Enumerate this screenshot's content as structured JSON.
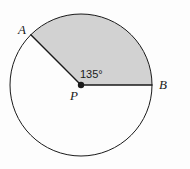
{
  "figure": {
    "kind": "circle-sector-diagram",
    "background_color": "#fdfdfd",
    "stroke_color": "#1a1a1a",
    "sector_fill_color": "#d2d2d2",
    "labels": {
      "point_a": "A",
      "point_b": "B",
      "center_p": "P",
      "angle": "135°"
    },
    "geometry": {
      "center_x": 81,
      "center_y": 85,
      "radius": 71,
      "start_angle_deg": 0,
      "end_angle_deg": 135,
      "sector_angle_deg": 135,
      "center_dot_radius": 3.2,
      "circle_stroke_width": 1,
      "radius_stroke_width": 1.4
    }
  }
}
